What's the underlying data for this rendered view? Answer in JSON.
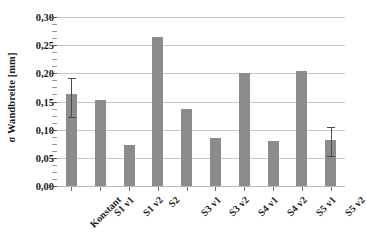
{
  "chart_data": {
    "type": "bar",
    "title": "",
    "subtitle": "",
    "xlabel": "",
    "ylabel": "σ Wandbreite [mm]",
    "ylim": [
      0.0,
      0.3
    ],
    "ytick_step": 0.05,
    "yticks": [
      0.0,
      0.05,
      0.1,
      0.15,
      0.2,
      0.25,
      0.3
    ],
    "ytick_labels": [
      "0,00",
      "0,05",
      "0,10",
      "0,15",
      "0,20",
      "0,25",
      "0,30"
    ],
    "grid": "horizontal",
    "legend": "none",
    "bar_color": "#8c8c8c",
    "error_bar_color": "#4a4a4a",
    "gridline_color": "#c9c9c9",
    "axis_color": "#6f6f6f",
    "background": "#ffffff",
    "decimal_separator": ",",
    "categories": [
      "Konstant",
      "S1 v1",
      "S1 v2",
      "S2",
      "S3 v1",
      "S3 v2",
      "S4 v1",
      "S4 v2",
      "S5 v1",
      "S5 v2"
    ],
    "values": [
      0.163,
      0.152,
      0.072,
      0.265,
      0.137,
      0.086,
      0.2,
      0.08,
      0.205,
      0.081
    ],
    "errors": [
      {
        "index": 0,
        "lower": 0.04,
        "upper": 0.028
      },
      {
        "index": 9,
        "lower": 0.028,
        "upper": 0.023
      }
    ],
    "series": [
      {
        "name": "σ Wandbreite",
        "values": [
          0.163,
          0.152,
          0.072,
          0.265,
          0.137,
          0.086,
          0.2,
          0.08,
          0.205,
          0.081
        ]
      }
    ]
  }
}
